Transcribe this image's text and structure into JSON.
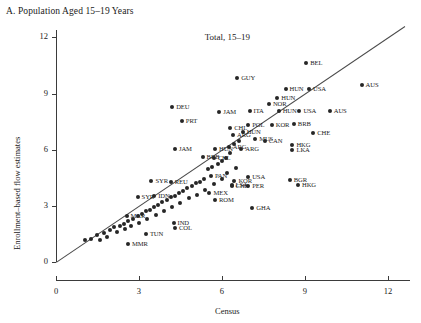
{
  "panel": {
    "title": "A. Population Aged 15–19 Years"
  },
  "chart_data": {
    "type": "scatter",
    "title": "Total, 15–19",
    "xlabel": "Census",
    "ylabel": "Enrollment–based flow estimates",
    "xlim": [
      0,
      12.8
    ],
    "ylim": [
      0,
      12.4
    ],
    "xticks": [
      0,
      3,
      6,
      9,
      12
    ],
    "yticks": [
      0,
      3,
      6,
      9,
      12
    ],
    "grid": false,
    "legend": null,
    "reference_line": {
      "type": "45-degree",
      "from": [
        0,
        0
      ],
      "to": [
        12.6,
        12.6
      ]
    },
    "marker_color": "#262626",
    "points": [
      {
        "label": "BEL",
        "x": 9.05,
        "y": 10.65
      },
      {
        "label": "AUS",
        "x": 11.05,
        "y": 9.45
      },
      {
        "label": "GUY",
        "x": 6.55,
        "y": 9.85
      },
      {
        "label": "HUN",
        "x": 8.3,
        "y": 9.25
      },
      {
        "label": "USA",
        "x": 9.15,
        "y": 9.25
      },
      {
        "label": "HUN",
        "x": 8.0,
        "y": 8.75
      },
      {
        "label": "NOR",
        "x": 7.7,
        "y": 8.45
      },
      {
        "label": "DEU",
        "x": 4.2,
        "y": 8.3
      },
      {
        "label": "ITA",
        "x": 7.0,
        "y": 8.05
      },
      {
        "label": "HUN",
        "x": 8.05,
        "y": 8.05
      },
      {
        "label": "USA",
        "x": 8.8,
        "y": 8.05
      },
      {
        "label": "AUS",
        "x": 9.9,
        "y": 8.05
      },
      {
        "label": "JAM",
        "x": 5.9,
        "y": 8.0
      },
      {
        "label": "PRT",
        "x": 4.55,
        "y": 7.55
      },
      {
        "label": "POL",
        "x": 6.95,
        "y": 7.3
      },
      {
        "label": "KOR",
        "x": 7.8,
        "y": 7.3
      },
      {
        "label": "BRB",
        "x": 8.6,
        "y": 7.35
      },
      {
        "label": "CHE",
        "x": 9.3,
        "y": 6.9
      },
      {
        "label": "HUN",
        "x": 6.75,
        "y": 6.95
      },
      {
        "label": "ARG",
        "x": 6.4,
        "y": 6.8
      },
      {
        "label": "CHL",
        "x": 6.3,
        "y": 7.15
      },
      {
        "label": "MUS",
        "x": 7.2,
        "y": 6.6
      },
      {
        "label": "CAN",
        "x": 7.55,
        "y": 6.45
      },
      {
        "label": "HKG",
        "x": 8.55,
        "y": 6.25
      },
      {
        "label": "LKA",
        "x": 8.55,
        "y": 6.0
      },
      {
        "label": "ARG",
        "x": 6.25,
        "y": 6.15
      },
      {
        "label": "JAM",
        "x": 4.3,
        "y": 6.05
      },
      {
        "label": "HUN",
        "x": 5.75,
        "y": 6.05
      },
      {
        "label": "ARG",
        "x": 6.7,
        "y": 6.05
      },
      {
        "label": "BRB",
        "x": 5.3,
        "y": 5.6
      },
      {
        "label": "CHL",
        "x": 5.7,
        "y": 5.55
      },
      {
        "label": "BGR",
        "x": 8.45,
        "y": 4.4
      },
      {
        "label": "HKG",
        "x": 8.75,
        "y": 4.1
      },
      {
        "label": "SYR",
        "x": 3.45,
        "y": 4.35
      },
      {
        "label": "REU",
        "x": 4.15,
        "y": 4.3
      },
      {
        "label": "PAN",
        "x": 5.6,
        "y": 4.6
      },
      {
        "label": "KOR",
        "x": 6.45,
        "y": 4.35
      },
      {
        "label": "USA",
        "x": 6.95,
        "y": 4.55
      },
      {
        "label": "LSA",
        "x": 6.35,
        "y": 4.1
      },
      {
        "label": "CHE",
        "x": 6.35,
        "y": 4.05
      },
      {
        "label": "PER",
        "x": 6.95,
        "y": 4.05
      },
      {
        "label": "MEX",
        "x": 5.55,
        "y": 3.7
      },
      {
        "label": "ROM",
        "x": 5.75,
        "y": 3.3
      },
      {
        "label": "SYR",
        "x": 2.95,
        "y": 3.45
      },
      {
        "label": "IDN",
        "x": 3.55,
        "y": 3.55
      },
      {
        "label": "GHA",
        "x": 7.1,
        "y": 2.9
      },
      {
        "label": "MAR",
        "x": 2.55,
        "y": 2.45
      },
      {
        "label": "IND",
        "x": 4.25,
        "y": 2.1
      },
      {
        "label": "COL",
        "x": 4.3,
        "y": 1.8
      },
      {
        "label": "TUN",
        "x": 3.25,
        "y": 1.5
      },
      {
        "label": "MMR",
        "x": 2.6,
        "y": 0.95
      },
      {
        "label": "",
        "x": 1.05,
        "y": 1.2
      },
      {
        "label": "",
        "x": 1.25,
        "y": 1.25
      },
      {
        "label": "",
        "x": 1.5,
        "y": 1.45
      },
      {
        "label": "",
        "x": 1.75,
        "y": 1.55
      },
      {
        "label": "",
        "x": 1.95,
        "y": 1.7
      },
      {
        "label": "",
        "x": 2.1,
        "y": 1.85
      },
      {
        "label": "",
        "x": 2.3,
        "y": 1.95
      },
      {
        "label": "",
        "x": 2.45,
        "y": 2.05
      },
      {
        "label": "",
        "x": 2.6,
        "y": 2.2
      },
      {
        "label": "",
        "x": 2.8,
        "y": 2.3
      },
      {
        "label": "",
        "x": 2.95,
        "y": 2.45
      },
      {
        "label": "",
        "x": 3.1,
        "y": 2.55
      },
      {
        "label": "",
        "x": 3.25,
        "y": 2.7
      },
      {
        "label": "",
        "x": 3.4,
        "y": 2.8
      },
      {
        "label": "",
        "x": 3.55,
        "y": 2.95
      },
      {
        "label": "",
        "x": 3.7,
        "y": 3.05
      },
      {
        "label": "",
        "x": 3.85,
        "y": 3.2
      },
      {
        "label": "",
        "x": 4.0,
        "y": 3.3
      },
      {
        "label": "",
        "x": 4.15,
        "y": 3.45
      },
      {
        "label": "",
        "x": 4.3,
        "y": 3.55
      },
      {
        "label": "",
        "x": 4.45,
        "y": 3.7
      },
      {
        "label": "",
        "x": 4.6,
        "y": 3.8
      },
      {
        "label": "",
        "x": 4.75,
        "y": 3.95
      },
      {
        "label": "",
        "x": 4.9,
        "y": 4.05
      },
      {
        "label": "",
        "x": 5.05,
        "y": 4.2
      },
      {
        "label": "",
        "x": 5.2,
        "y": 4.3
      },
      {
        "label": "",
        "x": 5.35,
        "y": 4.45
      },
      {
        "label": "",
        "x": 5.5,
        "y": 4.95
      },
      {
        "label": "",
        "x": 5.65,
        "y": 5.1
      },
      {
        "label": "",
        "x": 5.85,
        "y": 5.25
      },
      {
        "label": "",
        "x": 6.0,
        "y": 5.4
      },
      {
        "label": "",
        "x": 6.15,
        "y": 5.55
      },
      {
        "label": "",
        "x": 6.3,
        "y": 5.85
      },
      {
        "label": "",
        "x": 6.45,
        "y": 6.3
      },
      {
        "label": "",
        "x": 6.6,
        "y": 6.45
      },
      {
        "label": "",
        "x": 1.6,
        "y": 1.2
      },
      {
        "label": "",
        "x": 1.85,
        "y": 1.35
      },
      {
        "label": "",
        "x": 2.2,
        "y": 1.6
      },
      {
        "label": "",
        "x": 2.5,
        "y": 1.75
      },
      {
        "label": "",
        "x": 2.7,
        "y": 1.9
      },
      {
        "label": "",
        "x": 3.0,
        "y": 2.1
      },
      {
        "label": "",
        "x": 3.3,
        "y": 2.3
      },
      {
        "label": "",
        "x": 3.6,
        "y": 2.5
      },
      {
        "label": "",
        "x": 3.9,
        "y": 2.75
      },
      {
        "label": "",
        "x": 4.2,
        "y": 2.95
      },
      {
        "label": "",
        "x": 4.5,
        "y": 3.15
      },
      {
        "label": "",
        "x": 4.8,
        "y": 3.4
      },
      {
        "label": "",
        "x": 5.1,
        "y": 3.6
      },
      {
        "label": "",
        "x": 5.4,
        "y": 3.85
      },
      {
        "label": "",
        "x": 5.7,
        "y": 4.15
      },
      {
        "label": "",
        "x": 6.0,
        "y": 4.45
      },
      {
        "label": "",
        "x": 6.2,
        "y": 4.75
      },
      {
        "label": "",
        "x": 6.5,
        "y": 5.05
      }
    ]
  }
}
